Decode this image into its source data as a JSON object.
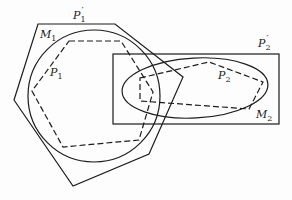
{
  "diagram": {
    "labels": {
      "P1_prime": {
        "base": "P",
        "sub": "1",
        "prime": "′"
      },
      "M1": {
        "base": "M",
        "sub": "1"
      },
      "P1": {
        "base": "P",
        "sub": "1"
      },
      "P2_prime": {
        "base": "P",
        "sub": "2",
        "prime": "′"
      },
      "P2": {
        "base": "P",
        "sub": "2"
      },
      "M2": {
        "base": "M",
        "sub": "2"
      }
    },
    "shapes": {
      "P1_prime_outer_polygon": "38,24 115,24 183,77 149,154 73,186 14,100",
      "M1_circle": {
        "cx": 94,
        "cy": 96,
        "r": 66
      },
      "P1_dashed_hexagon": "69,41 121,41 153,92 139,140 63,147 32,91",
      "P2_prime_rectangle": {
        "x": 113,
        "y": 54,
        "w": 166,
        "h": 70
      },
      "M2_ellipse": {
        "cx": 195,
        "cy": 88,
        "rx": 73,
        "ry": 30,
        "rotate": -3
      },
      "P2_dashed_polygon": "140,78 209,62 263,82 249,109 140,101"
    }
  }
}
